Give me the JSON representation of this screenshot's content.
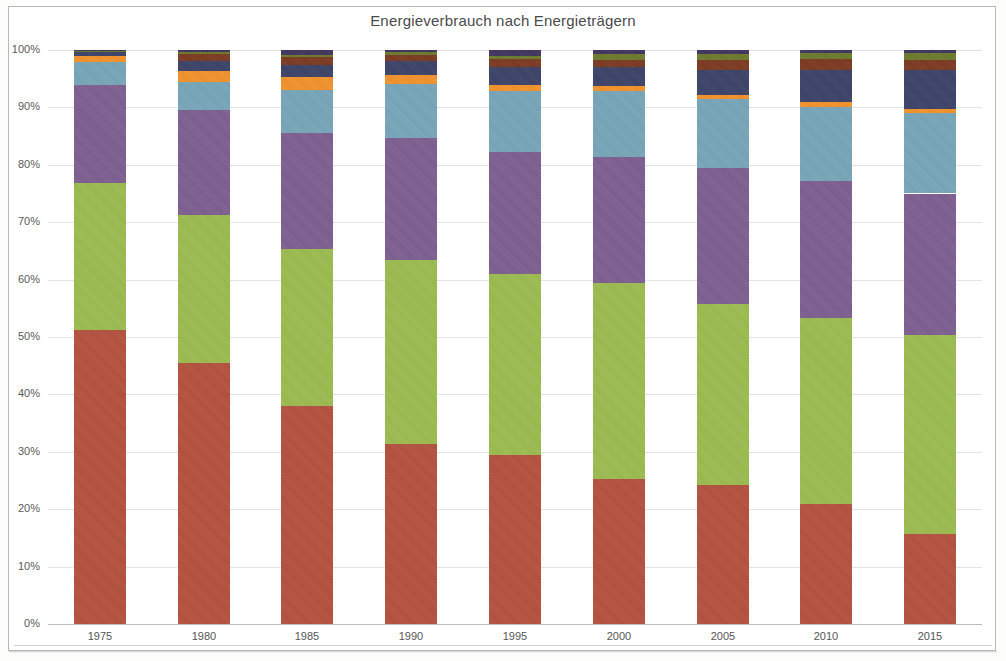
{
  "chart_data": {
    "type": "bar",
    "subtype": "stacked-percentage",
    "title": "Energieverbrauch nach Energieträgern",
    "xlabel": "",
    "ylabel": "",
    "ylim": [
      0,
      100
    ],
    "grid": true,
    "legend_position": "none",
    "categories": [
      "1975",
      "1980",
      "1985",
      "1990",
      "1995",
      "2000",
      "2005",
      "2010",
      "2015"
    ],
    "ytick_labels": [
      "0%",
      "10%",
      "20%",
      "30%",
      "40%",
      "50%",
      "60%",
      "70%",
      "80%",
      "90%",
      "100%"
    ],
    "ytick_values": [
      0,
      10,
      20,
      30,
      40,
      50,
      60,
      70,
      80,
      90,
      100
    ],
    "series": [
      {
        "name": "Mineralöl",
        "color": "#b4513f",
        "values": [
          51.3,
          45.4,
          37.9,
          31.4,
          29.5,
          25.2,
          24.3,
          20.9,
          15.7
        ]
      },
      {
        "name": "Steinkohle",
        "color": "#9bbb4f",
        "values": [
          25.5,
          25.8,
          27.5,
          32.0,
          31.4,
          34.2,
          31.4,
          32.4,
          34.6
        ]
      },
      {
        "name": "Braunkohle",
        "color": "#7d5f90",
        "values": [
          17.1,
          18.4,
          20.2,
          21.3,
          21.4,
          22.0,
          23.7,
          23.9,
          24.7
        ]
      },
      {
        "name": "Erdgas",
        "color": "#77a5b8",
        "values": [
          4.0,
          4.9,
          7.5,
          9.4,
          10.5,
          11.5,
          12.1,
          12.9,
          14.0
        ]
      },
      {
        "name": "Kernenergie",
        "color": "#f0922b",
        "values": [
          1.0,
          1.8,
          2.2,
          1.5,
          1.1,
          0.9,
          0.7,
          0.8,
          0.7
        ]
      },
      {
        "name": "Wasserkraft",
        "color": "#3c4368",
        "values": [
          0.7,
          1.8,
          2.1,
          2.4,
          3.1,
          3.2,
          4.4,
          5.7,
          6.8
        ]
      },
      {
        "name": "Windkraft",
        "color": "#7b3a22",
        "values": [
          0.2,
          1.2,
          1.3,
          1.2,
          1.4,
          1.3,
          1.7,
          1.8,
          1.8
        ]
      },
      {
        "name": "Biomasse",
        "color": "#6b7a2c",
        "values": [
          0.1,
          0.4,
          0.5,
          0.5,
          0.6,
          1.0,
          1.0,
          1.0,
          1.1
        ]
      },
      {
        "name": "Sonstige",
        "color": "#40355e",
        "values": [
          0.1,
          0.3,
          0.8,
          0.3,
          1.0,
          0.7,
          0.7,
          0.6,
          0.6
        ]
      }
    ]
  },
  "axis": {
    "top_percent_label": "100%",
    "bottom_percent_label": "0%"
  }
}
